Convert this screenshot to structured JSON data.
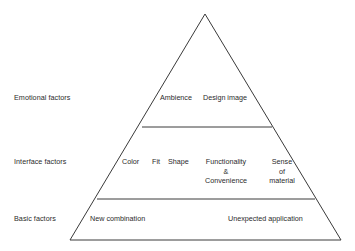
{
  "diagram": {
    "type": "pyramid",
    "title": "",
    "background_color": "#ffffff",
    "line_color": "#3a3a3a",
    "text_color": "#2b2b2b",
    "tiers": [
      {
        "id": "emotional",
        "label": "Emotional factors",
        "items": [
          {
            "id": "ambience",
            "text": "Ambience"
          },
          {
            "id": "design-image",
            "text": "Design image"
          }
        ]
      },
      {
        "id": "interface",
        "label": "Interface factors",
        "items": [
          {
            "id": "color",
            "text": "Color"
          },
          {
            "id": "fit",
            "text": "Fit"
          },
          {
            "id": "shape",
            "text": "Shape"
          },
          {
            "id": "functionality",
            "text": "Functionality\n&\nConvenience"
          },
          {
            "id": "sense-of-material",
            "text": "Sense\nof\nmaterial"
          }
        ]
      },
      {
        "id": "basic",
        "label": "Basic factors",
        "items": [
          {
            "id": "new-combination",
            "text": "New combination"
          },
          {
            "id": "unexpected-application",
            "text": "Unexpected application"
          }
        ]
      }
    ],
    "labels": {
      "emotional": "Emotional factors",
      "interface": "Interface factors",
      "basic": "Basic factors"
    },
    "items": {
      "ambience": "Ambience",
      "design_image": "Design image",
      "color": "Color",
      "fit": "Fit",
      "shape": "Shape",
      "functionality_line1": "Functionality",
      "functionality_line2": "&",
      "functionality_line3": "Convenience",
      "sense_line1": "Sense",
      "sense_line2": "of",
      "sense_line3": "material",
      "new_combination": "New combination",
      "unexpected_application": "Unexpected application"
    }
  }
}
